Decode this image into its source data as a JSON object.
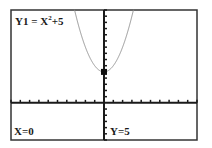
{
  "chart_data": {
    "type": "line",
    "title": "",
    "function_label": "Y1 = X²+5",
    "function_label_parts": {
      "prefix": "Y1 = X",
      "exponent": "2",
      "suffix": "+5"
    },
    "equation": "y = x^2 + 5",
    "xlabel": "",
    "ylabel": "",
    "xlim": [
      -10,
      10
    ],
    "ylim": [
      -6,
      15
    ],
    "xscl": 1,
    "yscl": 1,
    "grid": false,
    "series": [
      {
        "name": "Y1",
        "expr": "x^2+5",
        "color": "#8a8a8a"
      }
    ],
    "cursor": {
      "x": 0,
      "y": 5
    },
    "readout": {
      "x_text": "X=0",
      "y_text": "Y=5"
    }
  },
  "colors": {
    "axis": "#1a1a1a",
    "frame": "#333333",
    "curve": "#8a8a8a",
    "cursor": "#111111"
  }
}
